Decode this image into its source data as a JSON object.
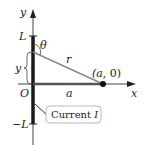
{
  "diagram": {
    "axes": {
      "x_label": "x",
      "y_label": "y",
      "origin_label": "O"
    },
    "ticks": {
      "top_label": "L",
      "bottom_label": "−L"
    },
    "segment_labels": {
      "y_label": "y",
      "r_label": "r",
      "a_label": "a",
      "theta_label": "θ"
    },
    "point": {
      "label": "(a, 0)"
    },
    "callout": {
      "text": "Current ",
      "italic": "I"
    },
    "colors": {
      "wire": "#1a1a1a",
      "axis": "#333333",
      "line_r": "#777777",
      "line_a": "#555555",
      "callout_border": "#bbbbbb"
    }
  }
}
